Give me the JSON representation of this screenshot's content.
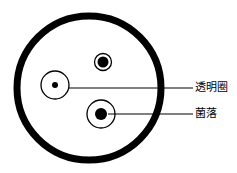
{
  "diagram": {
    "type": "petri-dish",
    "colors": {
      "stroke": "#000000",
      "background": "#ffffff"
    },
    "dish": {
      "cx": 89,
      "cy": 88,
      "r": 72,
      "stroke_width": 7
    },
    "colonies": [
      {
        "name": "top-colony",
        "cx": 103,
        "cy": 62,
        "halo_r": 8.5,
        "dot_r": 5.5
      },
      {
        "name": "left-colony",
        "cx": 55,
        "cy": 85,
        "halo_r": 14,
        "dot_r": 3
      },
      {
        "name": "bottom-colony",
        "cx": 101,
        "cy": 114,
        "halo_r": 14,
        "dot_r": 6
      }
    ],
    "labels": [
      {
        "text": "透明圈",
        "line": {
          "x1": 69,
          "y1": 88,
          "x2": 193,
          "y2": 88
        },
        "x": 195,
        "y": 82
      },
      {
        "text": "菌落",
        "line": {
          "x1": 108,
          "y1": 114,
          "x2": 193,
          "y2": 114
        },
        "x": 195,
        "y": 108
      }
    ]
  }
}
